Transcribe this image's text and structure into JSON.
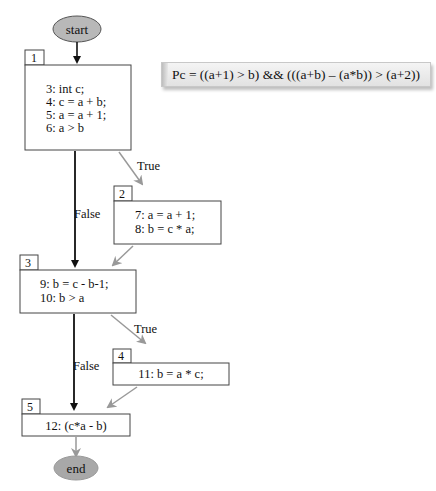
{
  "formula": {
    "text": "Pc = ((a+1) > b) && (((a+b) – (a*b)) > (a+2))"
  },
  "terminals": {
    "start": {
      "label": "start",
      "fill": "#b8b8b8"
    },
    "end": {
      "label": "end",
      "fill": "#a8a8a8"
    }
  },
  "nodes": [
    {
      "id": "1",
      "lines": [
        "3: int c;",
        "4: c = a + b;",
        "5: a = a + 1;",
        "6: a > b"
      ]
    },
    {
      "id": "2",
      "lines": [
        "7: a = a + 1;",
        "8: b = c * a;"
      ]
    },
    {
      "id": "3",
      "lines": [
        "9: b = c - b-1;",
        "10: b > a"
      ]
    },
    {
      "id": "4",
      "lines": [
        "11: b = a * c;"
      ]
    },
    {
      "id": "5",
      "lines": [
        "12: (c*a - b)"
      ]
    }
  ],
  "edges": [
    {
      "from": "start",
      "to": "1",
      "label": ""
    },
    {
      "from": "1",
      "to": "2",
      "label": "True"
    },
    {
      "from": "1",
      "to": "3",
      "label": "False"
    },
    {
      "from": "2",
      "to": "3",
      "label": ""
    },
    {
      "from": "3",
      "to": "4",
      "label": "True"
    },
    {
      "from": "3",
      "to": "5",
      "label": "False"
    },
    {
      "from": "4",
      "to": "5",
      "label": ""
    },
    {
      "from": "5",
      "to": "end",
      "label": ""
    }
  ],
  "colors": {
    "main_edge": "#111111",
    "branch_edge": "#999999",
    "node_border": "#444444"
  }
}
